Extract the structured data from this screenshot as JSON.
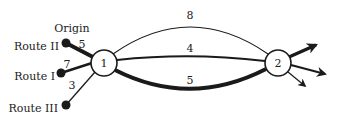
{
  "diagram": {
    "nodes": [
      {
        "id": "1",
        "label": "1"
      },
      {
        "id": "2",
        "label": "2"
      }
    ],
    "sources": [
      {
        "id": "route-ii",
        "label": "Route II",
        "top_label": "Origin",
        "weight": "5"
      },
      {
        "id": "route-i",
        "label": "Route I",
        "weight": "7"
      },
      {
        "id": "route-iii",
        "label": "Route III",
        "weight": "3"
      }
    ],
    "links": [
      {
        "id": "top",
        "from": "1",
        "to": "2",
        "weight": "8"
      },
      {
        "id": "middle",
        "from": "1",
        "to": "2",
        "weight": "4"
      },
      {
        "id": "bottom",
        "from": "1",
        "to": "2",
        "weight": "5"
      }
    ],
    "outputs": [
      {
        "id": "out-thick",
        "from": "2"
      },
      {
        "id": "out-medium",
        "from": "2"
      },
      {
        "id": "out-thin",
        "from": "2"
      }
    ],
    "colors": {
      "stroke": "#1a1a1a",
      "node_fill": "#ffffff"
    }
  }
}
